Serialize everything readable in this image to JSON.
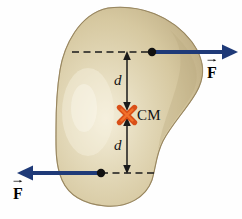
{
  "figure": {
    "background_color": "#fefefe"
  },
  "body_shape": {
    "name": "irregular-rigid-body",
    "fill_color": "#d9cca5",
    "fill_color_light": "#efe7d2",
    "fill_color_dark": "#b9a87c",
    "outline_color": "#9a8c63"
  },
  "center_of_mass": {
    "marker": "x-cross-marker",
    "label": "CM",
    "color": "#d94f18",
    "x": 127,
    "y": 115
  },
  "dimensions": [
    {
      "label": "d",
      "name": "distance-above-cm",
      "x": 122,
      "y": 73
    },
    {
      "label": "d",
      "name": "distance-below-cm",
      "x": 122,
      "y": 138
    }
  ],
  "forces": [
    {
      "name": "force-upper-right",
      "label": "F",
      "direction": "right",
      "color": "#1f3a78",
      "application_point": {
        "x": 152,
        "y": 52
      },
      "label_pos": {
        "x": 207,
        "y": 62
      }
    },
    {
      "name": "force-lower-left",
      "label": "F",
      "direction": "left",
      "color": "#1f3a78",
      "application_point": {
        "x": 101,
        "y": 173
      },
      "label_pos": {
        "x": 13,
        "y": 183
      }
    }
  ],
  "guides": {
    "dash_color": "#1a1a1a",
    "upper_line_y": 52,
    "lower_line_y": 173,
    "vertical_line_x": 127
  }
}
